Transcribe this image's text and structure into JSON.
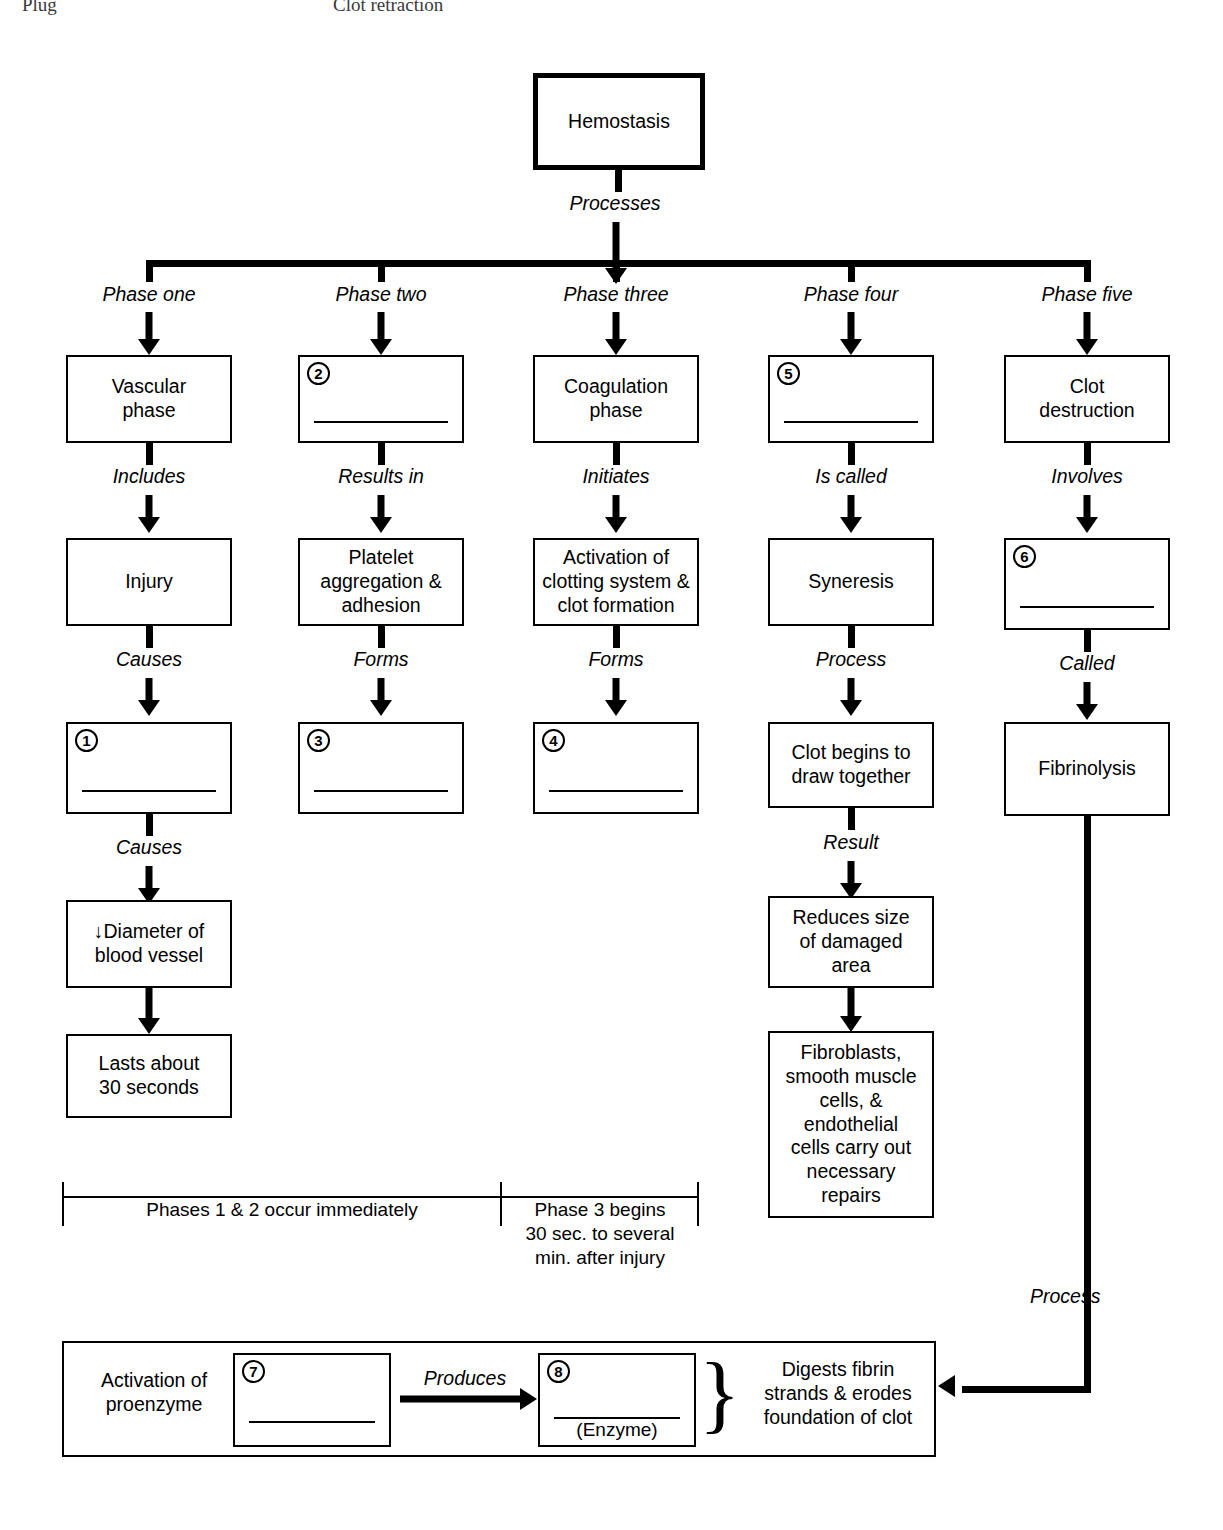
{
  "page_header": {
    "left_text": "Plug",
    "center_text": "Clot retraction"
  },
  "root": {
    "label": "Hemostasis",
    "connector_label": "Processes"
  },
  "phase_labels": [
    "Phase one",
    "Phase two",
    "Phase three",
    "Phase four",
    "Phase five"
  ],
  "columns": [
    {
      "phase": "Phase one",
      "nodes": [
        {
          "type": "text",
          "label": "Vascular\nphase"
        },
        {
          "type": "text",
          "label": "Injury"
        },
        {
          "type": "blank",
          "number": "1"
        },
        {
          "type": "text",
          "label": "↓Diameter of\nblood vessel"
        },
        {
          "type": "text",
          "label": "Lasts about\n30 seconds"
        }
      ],
      "connectors": [
        "Includes",
        "Causes",
        "Causes",
        ""
      ]
    },
    {
      "phase": "Phase two",
      "nodes": [
        {
          "type": "blank",
          "number": "2"
        },
        {
          "type": "text",
          "label": "Platelet\naggregation &\nadhesion"
        },
        {
          "type": "blank",
          "number": "3"
        }
      ],
      "connectors": [
        "Results in",
        "Forms"
      ]
    },
    {
      "phase": "Phase three",
      "nodes": [
        {
          "type": "text",
          "label": "Coagulation\nphase"
        },
        {
          "type": "text",
          "label": "Activation of\nclotting system &\nclot formation"
        },
        {
          "type": "blank",
          "number": "4"
        }
      ],
      "connectors": [
        "Initiates",
        "Forms"
      ]
    },
    {
      "phase": "Phase four",
      "nodes": [
        {
          "type": "blank",
          "number": "5"
        },
        {
          "type": "text",
          "label": "Syneresis"
        },
        {
          "type": "text",
          "label": "Clot begins to\ndraw together"
        },
        {
          "type": "text",
          "label": "Reduces size\nof damaged\narea"
        },
        {
          "type": "text",
          "label": "Fibroblasts,\nsmooth muscle\ncells, &\nendothelial\ncells carry out\nnecessary\nrepairs"
        }
      ],
      "connectors": [
        "Is called",
        "Process",
        "Result",
        ""
      ]
    },
    {
      "phase": "Phase five",
      "nodes": [
        {
          "type": "text",
          "label": "Clot\ndestruction"
        },
        {
          "type": "blank",
          "number": "6"
        },
        {
          "type": "text",
          "label": "Fibrinolysis"
        }
      ],
      "connectors": [
        "Involves",
        "Called"
      ]
    }
  ],
  "timing_bracket": {
    "left_caption": "Phases 1 & 2 occur immediately",
    "right_caption": "Phase 3 begins\n30 sec. to several\nmin. after injury"
  },
  "bottom_panel": {
    "left_caption": "Activation of\nproenzyme",
    "box7_number": "7",
    "produces_label": "Produces",
    "box8_number": "8",
    "box8_sublabel": "(Enzyme)",
    "right_caption": "Digests fibrin\nstrands & erodes\nfoundation of clot",
    "incoming_label": "Process"
  }
}
